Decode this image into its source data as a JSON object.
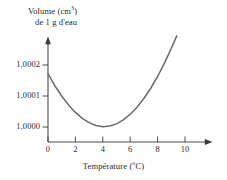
{
  "figure": {
    "background_color": "#ffffff",
    "line_color": "#555555",
    "axis_color": "#4a4a4a"
  },
  "chart_data": {
    "type": "line",
    "title": "",
    "ylabel_line1": "Volume (cm",
    "ylabel_sup": "3",
    "ylabel_line1_close": ")",
    "ylabel_line2": "de 1 g d'eau",
    "xlabel_text": "Température (",
    "xlabel_sup": "o",
    "xlabel_close": "C)",
    "xlabel": "Température (°C)",
    "ylabel": "Volume (cm³) de 1 g d'eau",
    "xlim": [
      0,
      11.8
    ],
    "ylim": [
      0.99995,
      1.000245
    ],
    "grid": false,
    "legend": null,
    "x_ticks": [
      0,
      2,
      4,
      6,
      8,
      10
    ],
    "x_tick_labels": [
      "0",
      "2",
      "4",
      "6",
      "8",
      "10"
    ],
    "y_ticks": [
      1.0,
      1.0001,
      1.0002
    ],
    "y_tick_labels": [
      "1,0000",
      "1,0001",
      "1,0002"
    ],
    "annotation_minimum": "1,0000 at 4 °C",
    "x": [
      0,
      0.5,
      1,
      1.5,
      2,
      2.5,
      3,
      3.5,
      4,
      4.5,
      5,
      5.5,
      6,
      6.5,
      7,
      7.5,
      8,
      8.5,
      9,
      9.4
    ],
    "values": [
      1.000172,
      1.000133,
      1.0001,
      1.000071,
      1.000047,
      1.000028,
      1.000014,
      1.000005,
      1.000001,
      1.000003,
      1.00001,
      1.000023,
      1.000041,
      1.000064,
      1.000092,
      1.000125,
      1.000163,
      1.000206,
      1.000254,
      1.000294
    ],
    "series": [
      {
        "name": "Volume of 1 g of water",
        "values": [
          1.000172,
          1.000133,
          1.0001,
          1.000071,
          1.000047,
          1.000028,
          1.000014,
          1.000005,
          1.000001,
          1.000003,
          1.00001,
          1.000023,
          1.000041,
          1.000064,
          1.000092,
          1.000125,
          1.000163,
          1.000206,
          1.000254,
          1.000294
        ]
      }
    ]
  }
}
